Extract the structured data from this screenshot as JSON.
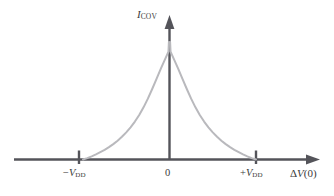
{
  "figure": {
    "background_color": "#ffffff",
    "axis_color": "#54545a",
    "curve_color": "#b9b9bd",
    "text_color": "#3a3a3a",
    "y_axis_label_main": "I",
    "y_axis_label_sub": "COV",
    "x_axis_title_delta": "Δ",
    "x_axis_title_var": "V",
    "x_axis_title_arg": "(0)",
    "tick_neg_sign": "−",
    "tick_neg_var": "V",
    "tick_neg_sub": "DD",
    "tick_zero": "0",
    "tick_pos_sign": "+",
    "tick_pos_var": "V",
    "tick_pos_sub": "DD"
  },
  "chart_data": {
    "type": "line",
    "title": "",
    "subtitle": "",
    "xlabel": "ΔV(0)",
    "ylabel": "I_COV",
    "grid": false,
    "legend": "none",
    "annotations": [],
    "xticks": [
      -1,
      0,
      1
    ],
    "xticklabels": [
      "−V_DD",
      "0",
      "+V_DD"
    ],
    "yticks": [],
    "yticklabels": [],
    "xlim": [
      -1.78,
      1.78
    ],
    "ylim": [
      0,
      1.12
    ],
    "series": [
      {
        "name": "I_COV",
        "comment": "Symmetric cusp peaking at x=0, decaying to 0 at x=±1 (±V_DD)",
        "x": [
          -1.0,
          -0.95,
          -0.9,
          -0.85,
          -0.8,
          -0.75,
          -0.7,
          -0.65,
          -0.6,
          -0.55,
          -0.5,
          -0.45,
          -0.4,
          -0.35,
          -0.3,
          -0.25,
          -0.2,
          -0.15,
          -0.1,
          -0.06,
          -0.03,
          -0.012,
          0.0,
          0.012,
          0.03,
          0.06,
          0.1,
          0.15,
          0.2,
          0.25,
          0.3,
          0.35,
          0.4,
          0.45,
          0.5,
          0.55,
          0.6,
          0.65,
          0.7,
          0.75,
          0.8,
          0.85,
          0.9,
          0.95,
          1.0
        ],
        "y": [
          0.0,
          0.012,
          0.027,
          0.043,
          0.062,
          0.082,
          0.105,
          0.131,
          0.16,
          0.193,
          0.231,
          0.274,
          0.323,
          0.379,
          0.444,
          0.518,
          0.6,
          0.686,
          0.774,
          0.84,
          0.888,
          0.918,
          1.0,
          0.918,
          0.888,
          0.84,
          0.774,
          0.686,
          0.6,
          0.518,
          0.444,
          0.379,
          0.323,
          0.274,
          0.231,
          0.193,
          0.16,
          0.131,
          0.105,
          0.082,
          0.062,
          0.043,
          0.027,
          0.012,
          0.0
        ]
      }
    ]
  }
}
